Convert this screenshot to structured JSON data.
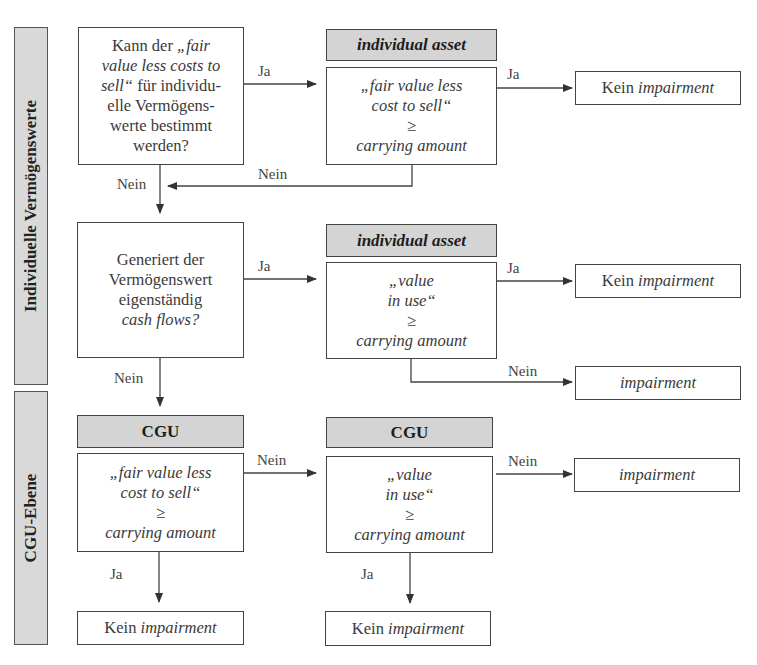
{
  "side_labels": {
    "individual": "Individuelle Vermögenswerte",
    "cgu": "CGU-Ebene"
  },
  "q1": {
    "line1_pre": "Kann der ",
    "line1_it": "„fair",
    "line2_it": "value less costs to",
    "line3_it": "sell“",
    "line3_post": " für individu-",
    "line4": "elle Vermögens-",
    "line5": "werte bestimmt",
    "line6": "werden?"
  },
  "q2": {
    "line1": "Generiert der",
    "line2": "Vermögenswert",
    "line3": "eigenständig",
    "line4_it": "cash flows?"
  },
  "headers": {
    "individual_asset_1": "individual asset",
    "individual_asset_2": "individual asset",
    "cgu_1": "CGU",
    "cgu_2": "CGU"
  },
  "tests": {
    "ia_fv": [
      "„fair value less",
      "cost to sell“",
      "≥",
      "carrying amount"
    ],
    "ia_viu": [
      "„value",
      "in use“",
      "≥",
      "carrying amount"
    ],
    "cgu_fv": [
      "„fair value less",
      "cost to sell“",
      "≥",
      "carrying amount"
    ],
    "cgu_viu": [
      "„value",
      "in use“",
      "≥",
      "carrying amount"
    ]
  },
  "results": {
    "no_impairment_prefix": "Kein ",
    "impairment": "impairment"
  },
  "edge_labels": {
    "yes": "Ja",
    "no": "Nein"
  },
  "colors": {
    "header_fill": "#d4d4d4",
    "side_fill": "#d9d9d9",
    "stroke": "#444444"
  }
}
